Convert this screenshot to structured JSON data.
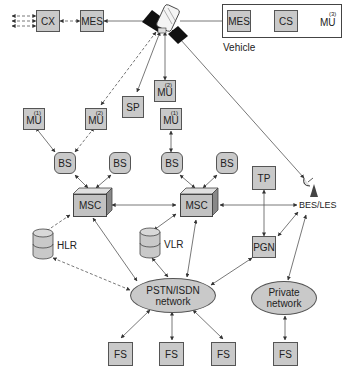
{
  "diagram": {
    "type": "mobile satellite network architecture",
    "nodes": {
      "cx": {
        "label": "CX"
      },
      "mes_left": {
        "label": "MES"
      },
      "vehicle": {
        "label": "Vehicle",
        "mes": "MES",
        "cs": "CS",
        "mu": "MU",
        "mu_sup": "(3)"
      },
      "sp": {
        "label": "SP"
      },
      "mu_sat": {
        "label": "MU",
        "sup": "(2)"
      },
      "mu_left1": {
        "label": "MU",
        "sup": "(1)"
      },
      "mu_left2": {
        "label": "MU",
        "sup": "(2)"
      },
      "mu_mid1": {
        "label": "MU",
        "sup": "(1)"
      },
      "bs1": {
        "label": "BS"
      },
      "bs2": {
        "label": "BS"
      },
      "bs3": {
        "label": "BS"
      },
      "bs4": {
        "label": "BS"
      },
      "msc_left": {
        "label": "MSC"
      },
      "msc_right": {
        "label": "MSC"
      },
      "tp": {
        "label": "TP"
      },
      "bes": {
        "label": "BES/LES"
      },
      "hlr": {
        "label": "HLR"
      },
      "vlr": {
        "label": "VLR"
      },
      "pgn": {
        "label": "PGN"
      },
      "pstn": {
        "line1": "PSTN/ISDN",
        "line2": "network"
      },
      "private": {
        "line1": "Private",
        "line2": "network"
      },
      "fs1": {
        "label": "FS"
      },
      "fs2": {
        "label": "FS"
      },
      "fs3": {
        "label": "FS"
      },
      "fs4": {
        "label": "FS"
      }
    },
    "colors": {
      "node_fill": "#c9c9c9",
      "border": "#555555",
      "line": "#444444",
      "satellite_panel": "#111111"
    }
  }
}
